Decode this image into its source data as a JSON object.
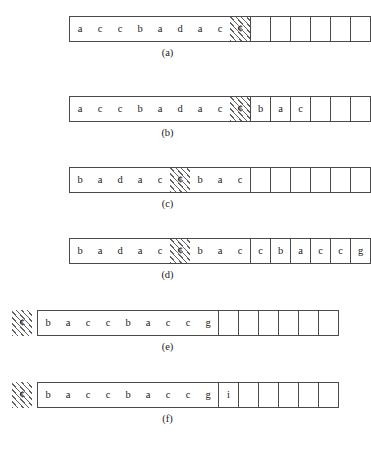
{
  "figure": {
    "cell_width": 20,
    "marker_char": "¢",
    "panels": [
      {
        "id": "panel-a",
        "caption": "(a)",
        "lead_marker": false,
        "left_offset": 32,
        "filled": [
          "a",
          "c",
          "c",
          "b",
          "a",
          "d",
          "a",
          "c",
          "¢"
        ],
        "hatch_index": 8,
        "divided": [
          "",
          "",
          "",
          "",
          "",
          ""
        ]
      },
      {
        "id": "panel-b",
        "caption": "(b)",
        "lead_marker": false,
        "left_offset": 32,
        "filled": [
          "a",
          "c",
          "c",
          "b",
          "a",
          "d",
          "a",
          "c",
          "¢"
        ],
        "hatch_index": 8,
        "divided": [
          "b",
          "a",
          "c",
          "",
          "",
          ""
        ]
      },
      {
        "id": "panel-c",
        "caption": "(c)",
        "lead_marker": false,
        "left_offset": 32,
        "filled": [
          "b",
          "a",
          "d",
          "a",
          "c",
          "¢",
          "b",
          "a",
          "c"
        ],
        "hatch_index": 5,
        "divided": [
          "",
          "",
          "",
          "",
          "",
          ""
        ]
      },
      {
        "id": "panel-d",
        "caption": "(d)",
        "lead_marker": false,
        "left_offset": 32,
        "filled": [
          "b",
          "a",
          "d",
          "a",
          "c",
          "¢",
          "b",
          "a",
          "c"
        ],
        "hatch_index": 5,
        "divided": [
          "c",
          "b",
          "a",
          "c",
          "c",
          "g"
        ]
      },
      {
        "id": "panel-e",
        "caption": "(e)",
        "lead_marker": true,
        "left_offset": 0,
        "filled": [
          "b",
          "a",
          "c",
          "c",
          "b",
          "a",
          "c",
          "c",
          "g"
        ],
        "hatch_index": -1,
        "divided": [
          "",
          "",
          "",
          "",
          "",
          ""
        ]
      },
      {
        "id": "panel-f",
        "caption": "(f)",
        "lead_marker": true,
        "left_offset": 0,
        "filled": [
          "b",
          "a",
          "c",
          "c",
          "b",
          "a",
          "c",
          "c",
          "g"
        ],
        "hatch_index": -1,
        "divided": [
          "i",
          "",
          "",
          "",
          "",
          ""
        ]
      }
    ]
  }
}
